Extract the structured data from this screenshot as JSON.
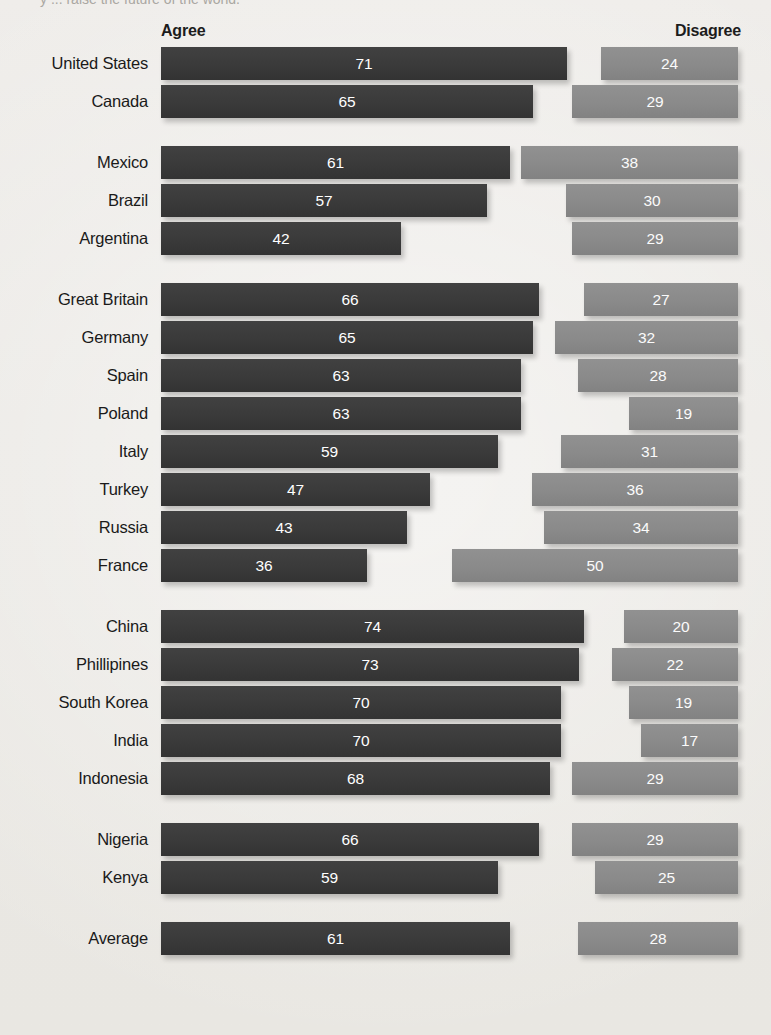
{
  "chart_data": {
    "type": "bar",
    "title": "y ... raise the future of the world.",
    "subtitle": "",
    "xlabel": "",
    "ylabel": "",
    "orientation": "horizontal",
    "grid": false,
    "legend_position": "top",
    "xlim": [
      0,
      100
    ],
    "series": [
      {
        "name": "Agree",
        "color": "#3a3a3a",
        "align": "left"
      },
      {
        "name": "Disagree",
        "color": "#8a8a8a",
        "align": "right"
      }
    ],
    "groups": [
      {
        "name": "North America",
        "rows": [
          {
            "category": "United States",
            "agree": 71,
            "disagree": 24
          },
          {
            "category": "Canada",
            "agree": 65,
            "disagree": 29
          }
        ]
      },
      {
        "name": "Latin America",
        "rows": [
          {
            "category": "Mexico",
            "agree": 61,
            "disagree": 38
          },
          {
            "category": "Brazil",
            "agree": 57,
            "disagree": 30
          },
          {
            "category": "Argentina",
            "agree": 42,
            "disagree": 29
          }
        ]
      },
      {
        "name": "Europe",
        "rows": [
          {
            "category": "Great Britain",
            "agree": 66,
            "disagree": 27
          },
          {
            "category": "Germany",
            "agree": 65,
            "disagree": 32
          },
          {
            "category": "Spain",
            "agree": 63,
            "disagree": 28
          },
          {
            "category": "Poland",
            "agree": 63,
            "disagree": 19
          },
          {
            "category": "Italy",
            "agree": 59,
            "disagree": 31
          },
          {
            "category": "Turkey",
            "agree": 47,
            "disagree": 36
          },
          {
            "category": "Russia",
            "agree": 43,
            "disagree": 34
          },
          {
            "category": "France",
            "agree": 36,
            "disagree": 50
          }
        ]
      },
      {
        "name": "Asia",
        "rows": [
          {
            "category": "China",
            "agree": 74,
            "disagree": 20
          },
          {
            "category": "Phillipines",
            "agree": 73,
            "disagree": 22
          },
          {
            "category": "South Korea",
            "agree": 70,
            "disagree": 19
          },
          {
            "category": "India",
            "agree": 70,
            "disagree": 17
          },
          {
            "category": "Indonesia",
            "agree": 68,
            "disagree": 29
          }
        ]
      },
      {
        "name": "Africa",
        "rows": [
          {
            "category": "Nigeria",
            "agree": 66,
            "disagree": 29
          },
          {
            "category": "Kenya",
            "agree": 59,
            "disagree": 25
          }
        ]
      },
      {
        "name": "Summary",
        "rows": [
          {
            "category": "Average",
            "agree": 61,
            "disagree": 28
          }
        ]
      }
    ]
  },
  "headers": {
    "agree": "Agree",
    "disagree": "Disagree"
  },
  "colors": {
    "agree_bar": "#3a3a3a",
    "disagree_bar": "#8a8a8a",
    "background": "#eceae6",
    "value_text": "#ffffff",
    "label_text": "#1a1a1a"
  },
  "layout": {
    "bar_left_px": 161,
    "bar_right_px": 738,
    "px_per_unit": 5.72,
    "bar_height_px": 33,
    "row_gap_px": 5,
    "group_gap_px": 28,
    "first_row_top_px": 47
  }
}
